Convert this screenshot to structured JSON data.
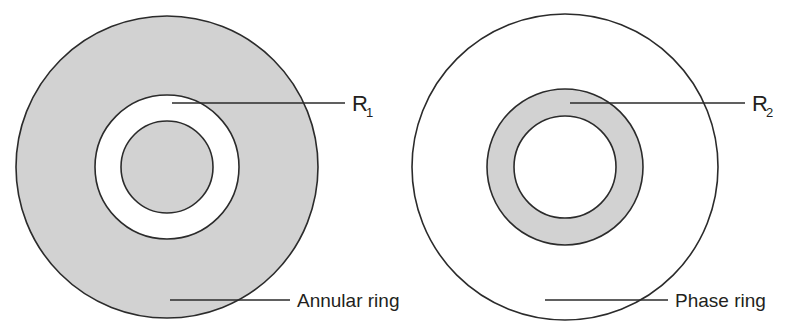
{
  "figure": {
    "background_color": "#ffffff",
    "shade_color": "#d2d2d2",
    "line_color": "#2b2b2b"
  },
  "panels": [
    {
      "id": "left",
      "name": "annular-ring-panel",
      "outer_circle": {
        "cx": 167,
        "cy": 167,
        "r": 151,
        "fill": "shaded"
      },
      "middle_circle": {
        "cx": 167,
        "cy": 167,
        "r": 72,
        "fill": "white"
      },
      "inner_circle": {
        "cx": 167,
        "cy": 167,
        "r": 46,
        "fill": "shaded"
      },
      "radius_label": {
        "text": "R",
        "subscript": "1"
      },
      "radius_leader": {
        "x1": 172,
        "y1": 103,
        "x2": 345,
        "y2": 103
      },
      "part_label": {
        "text": "Annular ring"
      },
      "part_leader": {
        "x1": 170,
        "y1": 300,
        "x2": 290,
        "y2": 300
      }
    },
    {
      "id": "right",
      "name": "phase-ring-panel",
      "outer_circle": {
        "cx": 565,
        "cy": 167,
        "r": 153,
        "fill": "white"
      },
      "middle_circle": {
        "cx": 565,
        "cy": 167,
        "r": 78,
        "fill": "shaded"
      },
      "inner_circle": {
        "cx": 565,
        "cy": 167,
        "r": 51,
        "fill": "white"
      },
      "radius_label": {
        "text": "R",
        "subscript": "2"
      },
      "radius_leader": {
        "x1": 570,
        "y1": 103,
        "x2": 745,
        "y2": 103
      },
      "part_label": {
        "text": "Phase ring"
      },
      "part_leader": {
        "x1": 545,
        "y1": 300,
        "x2": 668,
        "y2": 300
      }
    }
  ],
  "labels": {
    "r1_text": "R",
    "r1_sub": "1",
    "r2_text": "R",
    "r2_sub": "2",
    "annular_ring": "Annular ring",
    "phase_ring": "Phase ring"
  }
}
